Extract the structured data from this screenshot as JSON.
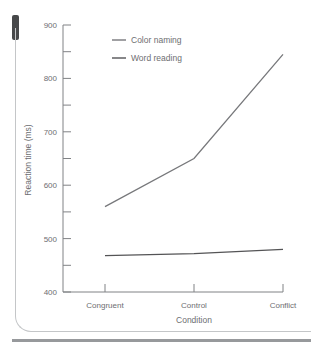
{
  "figure": {
    "colors": {
      "background": "#ffffff",
      "tab_marker": "#47484a",
      "figure_border": "#c4c6c8",
      "page_rule": "#97999c",
      "axis": "#808285",
      "text": "#6d6e71"
    }
  },
  "chart_data": {
    "type": "line",
    "title": "",
    "xlabel": "Condition",
    "ylabel": "Reaction time (ms)",
    "categories": [
      "Congruent",
      "Control",
      "Conflict"
    ],
    "series": [
      {
        "name": "Color naming",
        "values": [
          560,
          650,
          845
        ],
        "color": "#77787b"
      },
      {
        "name": "Word reading",
        "values": [
          468,
          472,
          480
        ],
        "color": "#545456"
      }
    ],
    "ylim": [
      400,
      900
    ],
    "ytick_major_step": 100,
    "ytick_minor_step": 50,
    "grid": false,
    "legend_position": "top-left-inside"
  }
}
